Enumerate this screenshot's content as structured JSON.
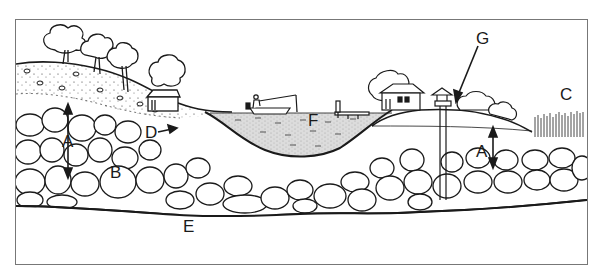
{
  "diagram": {
    "type": "groundwater cross-section illustration",
    "labels": {
      "A_left": "A",
      "A_right": "A",
      "B": "B",
      "C": "C",
      "D": "D",
      "E": "E",
      "F": "F",
      "G": "G"
    },
    "elements": [
      "left hill with trees and house",
      "lake with fisherman in boat",
      "dock",
      "right hill with house, well and shrubs",
      "wetland reeds",
      "gravel/boulder aquifer layer",
      "bedrock"
    ],
    "colors": {
      "line": "#1a1a1a",
      "background": "#ffffff",
      "water": "#d9d9d9",
      "frame": "#777777"
    }
  }
}
